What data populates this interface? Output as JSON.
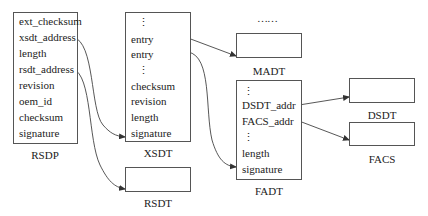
{
  "diagram": {
    "top_ellipsis": "……",
    "rsdp": {
      "title": "RSDP",
      "fields": [
        "ext_checksum",
        "xsdt_address",
        "length",
        "rsdt_address",
        "revision",
        "oem_id",
        "checksum",
        "signature"
      ]
    },
    "xsdt": {
      "title": "XSDT",
      "fields": [
        "⋮",
        "entry",
        "entry",
        "⋮",
        "checksum",
        "revision",
        "length",
        "signature"
      ]
    },
    "rsdt": {
      "title": "RSDT"
    },
    "madt": {
      "title": "MADT"
    },
    "fadt": {
      "title": "FADT",
      "fields": [
        "⋮",
        "DSDT_addr",
        "FACS_addr",
        "⋮",
        "length",
        "signature"
      ]
    },
    "dsdt": {
      "title": "DSDT"
    },
    "facs": {
      "title": "FACS"
    },
    "edges": [
      {
        "from": "RSDP.xsdt_address",
        "to": "XSDT"
      },
      {
        "from": "RSDP.rsdt_address",
        "to": "RSDT"
      },
      {
        "from": "XSDT.entry[0]",
        "to": "MADT"
      },
      {
        "from": "XSDT.entry[1]",
        "to": "FADT"
      },
      {
        "from": "FADT.DSDT_addr",
        "to": "DSDT"
      },
      {
        "from": "FADT.FACS_addr",
        "to": "FACS"
      }
    ]
  }
}
